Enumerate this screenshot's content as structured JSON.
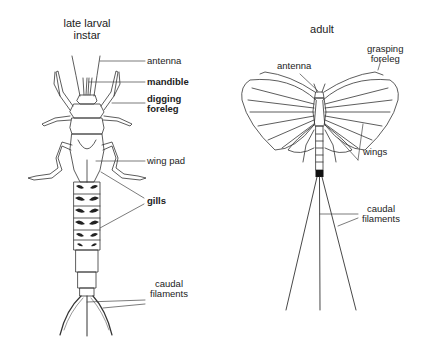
{
  "larva": {
    "title_line1": "late larval",
    "title_line2": "instar",
    "labels": {
      "antenna": "antenna",
      "mandible": "mandible",
      "digging_line1": "digging",
      "digging_line2": "foreleg",
      "wing_pad": "wing pad",
      "gills": "gills",
      "caudal_line1": "caudal",
      "caudal_line2": "filaments"
    }
  },
  "adult": {
    "title": "adult",
    "labels": {
      "antenna": "antenna",
      "grasping_line1": "grasping",
      "grasping_line2": "foreleg",
      "wings": "wings",
      "caudal_line1": "caudal",
      "caudal_line2": "filaments"
    }
  },
  "colors": {
    "stroke": "#333333",
    "text": "#222222",
    "background": "#ffffff"
  }
}
